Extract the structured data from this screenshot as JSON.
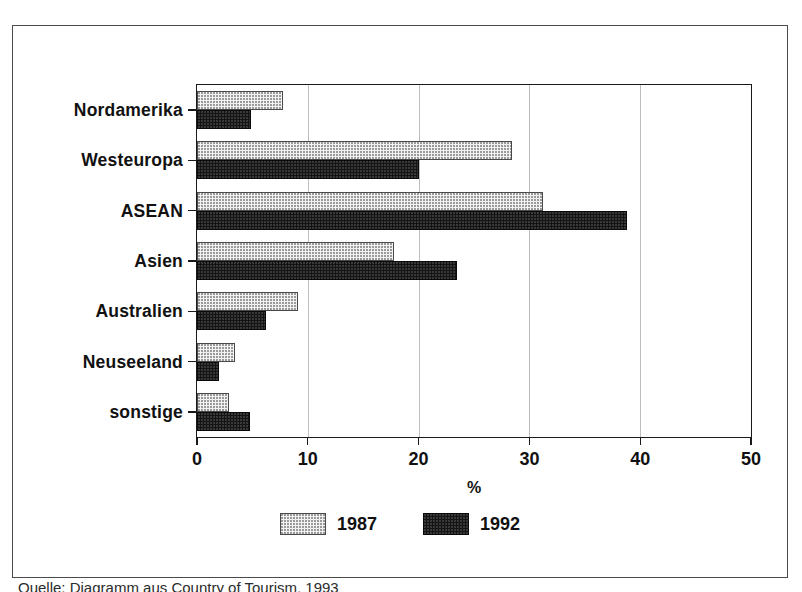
{
  "figure": {
    "caption": "Quelle: Diagramm aus Country of Tourism, 1993"
  },
  "chart_data": {
    "type": "bar",
    "orientation": "horizontal",
    "title": "",
    "xlabel": "%",
    "ylabel": "",
    "xlim": [
      0,
      50
    ],
    "xticks": [
      0,
      10,
      20,
      30,
      40,
      50
    ],
    "xtick_labels": [
      "0",
      "10",
      "20",
      "30",
      "40",
      "50"
    ],
    "grid": true,
    "grid_axis": "x",
    "legend_position": "bottom-center",
    "categories": [
      "Nordamerika",
      "Westeuropa",
      "ASEAN",
      "Asien",
      "Australien",
      "Neuseeland",
      "sonstige"
    ],
    "series": [
      {
        "name": "1987",
        "color": "#f2f2f2",
        "pattern": "dotted-light",
        "values": [
          7.8,
          28.4,
          31.2,
          17.8,
          9.1,
          3.4,
          2.9
        ]
      },
      {
        "name": "1992",
        "color": "#141414",
        "pattern": "solid-black",
        "values": [
          4.9,
          20.0,
          38.8,
          23.5,
          6.2,
          2.0,
          4.8
        ]
      }
    ]
  }
}
